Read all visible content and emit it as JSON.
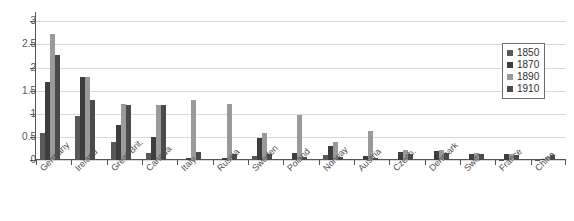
{
  "chart_data": {
    "type": "bar",
    "title": "",
    "subtitle": "",
    "xlabel": "",
    "ylabel": "",
    "ylim": [
      0,
      3.2
    ],
    "yticks": [
      0,
      0.5,
      1,
      1.5,
      2,
      2.5,
      3
    ],
    "ytick_labels": [
      "0",
      "0.5",
      "1",
      "1.5",
      "2",
      "2.5",
      "3"
    ],
    "grid": "horizontal",
    "legend_position": "upper-right",
    "categories": [
      "Germany",
      "Ireland",
      "Great Brit.",
      "Canada",
      "Italy",
      "Russia",
      "Sweden",
      "Poland",
      "Norway",
      "Austria",
      "Czech.",
      "Denmark",
      "Switz.",
      "France",
      "China"
    ],
    "series": [
      {
        "name": "1850",
        "color": "#595959",
        "values": [
          0.58,
          0.96,
          0.39,
          0.16,
          0.02,
          0.02,
          0.09,
          0.02,
          0.1,
          0.02,
          0.02,
          0.03,
          0.02,
          0.01,
          0.01
        ]
      },
      {
        "name": "1870",
        "color": "#3d3d3d",
        "values": [
          1.68,
          1.8,
          0.76,
          0.5,
          0.05,
          0.05,
          0.48,
          0.15,
          0.3,
          0.08,
          0.18,
          0.2,
          0.14,
          0.12,
          0.03
        ]
      },
      {
        "name": "1890",
        "color": "#9a9a9a",
        "values": [
          2.72,
          1.79,
          1.21,
          1.18,
          1.29,
          1.22,
          0.58,
          0.98,
          0.38,
          0.62,
          0.22,
          0.22,
          0.15,
          0.12,
          0.06
        ]
      },
      {
        "name": "1910",
        "color": "#4a4a4a",
        "values": [
          2.28,
          1.29,
          1.19,
          1.18,
          0.17,
          0.14,
          0.12,
          0.06,
          0.06,
          0.04,
          0.14,
          0.16,
          0.12,
          0.1,
          0.1
        ]
      }
    ]
  },
  "legend": {
    "items": [
      {
        "label": "1850"
      },
      {
        "label": "1870"
      },
      {
        "label": "1890"
      },
      {
        "label": "1910"
      }
    ]
  }
}
